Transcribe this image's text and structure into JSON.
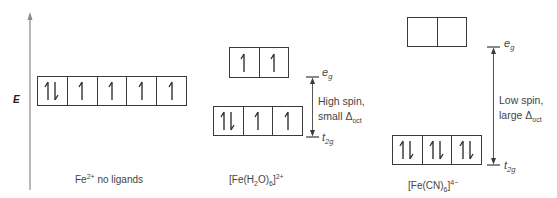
{
  "diagram": {
    "axis": {
      "label": "E"
    },
    "colors": {
      "line": "#3a3a3a",
      "axis": "#888888",
      "text": "#444444"
    },
    "panels": [
      {
        "id": "free-ion",
        "caption": {
          "base": "Fe",
          "sup": "2+",
          "rest": " no ligands"
        },
        "levels": [
          {
            "name": "d",
            "orbitals": [
              "up-down",
              "up",
              "up",
              "up",
              "up"
            ]
          }
        ]
      },
      {
        "id": "hexaaqua",
        "caption": {
          "open": "[Fe(H",
          "sub1": "2",
          "mid": "O)",
          "sub2": "6",
          "close": "]",
          "sup": "2+"
        },
        "levels": [
          {
            "name": "e_g",
            "label_main": "e",
            "label_sub": "g",
            "orbitals": [
              "up",
              "up"
            ]
          },
          {
            "name": "t_2g",
            "label_main": "t",
            "label_sub": "2g",
            "orbitals": [
              "up-down",
              "up",
              "up"
            ]
          }
        ],
        "splitting": {
          "line1": "High spin,",
          "line2_main": "small Δ",
          "line2_sub": "oct"
        }
      },
      {
        "id": "hexacyano",
        "caption": {
          "open": "[Fe(CN)",
          "sub1": "6",
          "close": "]",
          "sup": "4−"
        },
        "levels": [
          {
            "name": "e_g",
            "label_main": "e",
            "label_sub": "g",
            "orbitals": [
              "empty",
              "empty"
            ]
          },
          {
            "name": "t_2g",
            "label_main": "t",
            "label_sub": "2g",
            "orbitals": [
              "up-down",
              "up-down",
              "up-down"
            ]
          }
        ],
        "splitting": {
          "line1": "Low spin,",
          "line2_main": "large Δ",
          "line2_sub": "oct"
        }
      }
    ]
  }
}
